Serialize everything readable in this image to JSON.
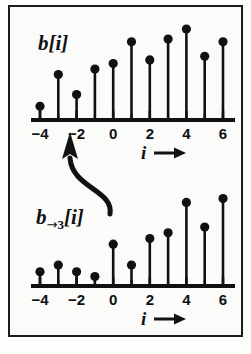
{
  "figure": {
    "background_color": "#fbfbfa",
    "border_color": "#1b1b1b",
    "stem_color": "#111111",
    "axis_color": "#111111",
    "arrow_color": "#111111"
  },
  "panels": [
    {
      "id": "top",
      "signal_label": "b[i]",
      "signal_label_base": "b",
      "signal_label_sub_arrow": "",
      "signal_label_sub_num": "",
      "signal_label_tail": "[i]",
      "x_axis_var": "i",
      "x_axis_arrow": "→"
    },
    {
      "id": "bottom",
      "signal_label": "b→3[i]",
      "signal_label_base": "b",
      "signal_label_sub_arrow": "→",
      "signal_label_sub_num": "3",
      "signal_label_tail": "[i]",
      "x_axis_var": "i",
      "x_axis_arrow": "→"
    }
  ],
  "annotation": {
    "name": "shift-arrow",
    "description": "curved arrow from bottom plot up to top plot",
    "head": "↑"
  },
  "chart_data": [
    {
      "type": "stem",
      "id": "top-stem-plot",
      "title": "b[i]",
      "xlabel": "i",
      "ylabel": "",
      "grid": false,
      "legend": false,
      "xlim": [
        -4.6,
        6.6
      ],
      "ylim": [
        0,
        1.05
      ],
      "xticks": [
        -4,
        -2,
        0,
        2,
        4,
        6
      ],
      "xticklabels": [
        "−4",
        "−2",
        "0",
        "2",
        "4",
        "6"
      ],
      "minor_xticks": [
        -3,
        -1,
        1,
        3,
        5
      ],
      "x": [
        -4,
        -3,
        -2,
        -1,
        0,
        1,
        2,
        3,
        4,
        5,
        6
      ],
      "values": [
        0.15,
        0.5,
        0.28,
        0.56,
        0.62,
        0.86,
        0.66,
        0.89,
        1.0,
        0.7,
        0.86
      ]
    },
    {
      "type": "stem",
      "id": "bottom-stem-plot",
      "title": "b→3[i]",
      "xlabel": "i",
      "ylabel": "",
      "grid": false,
      "legend": false,
      "xlim": [
        -4.6,
        6.6
      ],
      "ylim": [
        0,
        1.05
      ],
      "xticks": [
        -4,
        -2,
        0,
        2,
        4,
        6
      ],
      "xticklabels": [
        "−4",
        "−2",
        "0",
        "2",
        "4",
        "6"
      ],
      "minor_xticks": [
        -3,
        -1,
        1,
        3,
        5
      ],
      "x": [
        -4,
        -3,
        -2,
        -1,
        0,
        1,
        2,
        3,
        4,
        5,
        6
      ],
      "values": [
        0.15,
        0.22,
        0.15,
        0.1,
        0.44,
        0.22,
        0.5,
        0.56,
        0.88,
        0.62,
        0.92
      ]
    }
  ]
}
